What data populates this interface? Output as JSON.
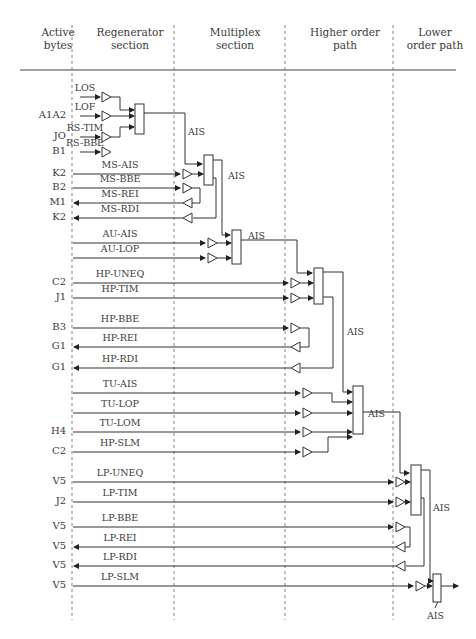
{
  "headers": [
    {
      "label": "Active\nbytes",
      "x": 38,
      "w": 40
    },
    {
      "label": "Regenerator\nsection",
      "x": 90,
      "w": 80
    },
    {
      "label": "Multiplex\nsection",
      "x": 195,
      "w": 80
    },
    {
      "label": "Higher order\npath",
      "x": 305,
      "w": 80
    },
    {
      "label": "Lower\norder path",
      "x": 400,
      "w": 70
    }
  ],
  "rows": [
    {
      "byte": "",
      "signal": "LOS",
      "y": 97
    },
    {
      "byte": "A1A2",
      "signal": "LOF",
      "y": 116
    },
    {
      "byte": "JO",
      "signal": "RS-TIM",
      "y": 137
    },
    {
      "byte": "B1",
      "signal": "RS-BBE",
      "y": 152
    },
    {
      "byte": "K2",
      "signal": "MS-AIS",
      "y": 174
    },
    {
      "byte": "B2",
      "signal": "MS-BBE",
      "y": 188
    },
    {
      "byte": "M1",
      "signal": "MS-REI",
      "y": 203
    },
    {
      "byte": "K2",
      "signal": "MS-RDI",
      "y": 218
    },
    {
      "byte": "",
      "signal": "AU-AIS",
      "y": 243
    },
    {
      "byte": "",
      "signal": "AU-LOP",
      "y": 258
    },
    {
      "byte": "C2",
      "signal": "HP-UNEQ",
      "y": 283
    },
    {
      "byte": "J1",
      "signal": "HP-TIM",
      "y": 298
    },
    {
      "byte": "B3",
      "signal": "HP-BBE",
      "y": 328
    },
    {
      "byte": "G1",
      "signal": "HP-REI",
      "y": 347
    },
    {
      "byte": "G1",
      "signal": "HP-RDI",
      "y": 368
    },
    {
      "byte": "",
      "signal": "TU-AIS",
      "y": 393
    },
    {
      "byte": "",
      "signal": "TU-LOP",
      "y": 413
    },
    {
      "byte": "H4",
      "signal": "TU-LOM",
      "y": 432
    },
    {
      "byte": "C2",
      "signal": "HP-SLM",
      "y": 452
    },
    {
      "byte": "V5",
      "signal": "LP-UNEQ",
      "y": 482
    },
    {
      "byte": "J2",
      "signal": "LP-TIM",
      "y": 502
    },
    {
      "byte": "V5",
      "signal": "LP-BBE",
      "y": 527
    },
    {
      "byte": "V5",
      "signal": "LP-REI",
      "y": 547
    },
    {
      "byte": "V5",
      "signal": "LP-RDI",
      "y": 566
    },
    {
      "byte": "V5",
      "signal": "LP-SLM",
      "y": 586
    }
  ],
  "ais_labels": [
    {
      "text": "AIS",
      "x": 188,
      "y": 126
    },
    {
      "text": "AIS",
      "x": 228,
      "y": 170
    },
    {
      "text": "AIS",
      "x": 248,
      "y": 230
    },
    {
      "text": "AIS",
      "x": 347,
      "y": 326
    },
    {
      "text": "AIS",
      "x": 368,
      "y": 408
    },
    {
      "text": "AIS",
      "x": 433,
      "y": 502
    },
    {
      "text": "AIS",
      "x": 427,
      "y": 610
    }
  ]
}
